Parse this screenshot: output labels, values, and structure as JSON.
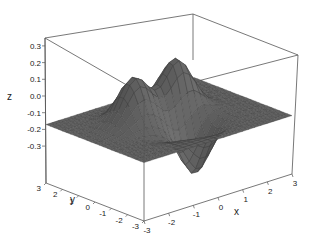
{
  "chart_data": {
    "type": "surface3d",
    "title": "",
    "xlabel": "x",
    "ylabel": "y",
    "zlabel": "z",
    "xlim": [
      -3,
      3
    ],
    "ylim": [
      -3,
      3
    ],
    "zlim": [
      -0.35,
      0.35
    ],
    "x_ticks": [
      "-3",
      "-2",
      "-1",
      "0",
      "1",
      "2",
      "3"
    ],
    "y_ticks": [
      "-3",
      "-2",
      "-1",
      "0",
      "1",
      "2",
      "3"
    ],
    "z_ticks": [
      "0.3",
      "0.2",
      "0.1",
      "0.0",
      "-0.1",
      "-0.2",
      "-0.3"
    ],
    "grid": false,
    "box": true,
    "surface_color": "#5a5a5a",
    "edge_color": "#3c3c3c",
    "features": [
      {
        "kind": "peak",
        "x": -1.0,
        "y": 0.6,
        "z": 0.28
      },
      {
        "kind": "peak",
        "x": 0.7,
        "y": 0.6,
        "z": 0.32
      },
      {
        "kind": "trough",
        "x": 0.4,
        "y": -0.9,
        "z": -0.32
      },
      {
        "kind": "trough",
        "x": -0.9,
        "y": -0.9,
        "z": -0.05
      }
    ]
  }
}
